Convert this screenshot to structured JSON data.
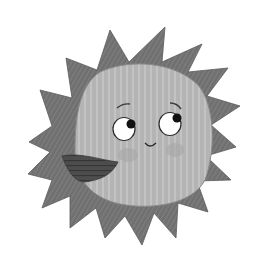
{
  "image": {
    "subject": "Smiling cartoon sun with spiky rays, looking up and to the right",
    "style": "grayscale hand-drawn illustration",
    "colors": {
      "background": "#ffffff",
      "rays": "#6e6e6e",
      "rays_dark": "#5a5a5a",
      "face": "#b4b4b4",
      "face_stripe": "#c2c2c2",
      "cheek": "#a3a3a3",
      "wedge": "#4a4a4a",
      "outline": "#2a2a2a",
      "eye_white": "#ffffff",
      "pupil": "#111111"
    }
  }
}
